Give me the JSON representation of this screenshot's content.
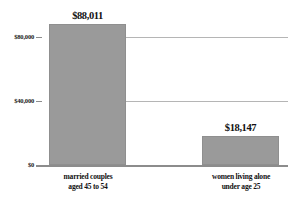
{
  "chart_data": {
    "type": "bar",
    "title": "",
    "subtitle": "",
    "xlabel": "",
    "ylabel": "",
    "orientation": "vertical",
    "grid": true,
    "legend": false,
    "legend_position": "none",
    "ylim": [
      0,
      100000
    ],
    "yticks": [
      0,
      40000,
      80000
    ],
    "ytick_labels": [
      "$0",
      "$40,000",
      "$80,000"
    ],
    "categories": [
      "married couples aged 45 to 54",
      "women living alone under age 25"
    ],
    "values": [
      88011,
      18147
    ],
    "value_labels": [
      "$88,011",
      "$18,147"
    ],
    "bar_color": "#9a9a9a",
    "gridline_color": "#b5b5b5",
    "axis_color": "#8c8c8c",
    "background_color": "#ffffff",
    "text_color": "#111111"
  },
  "axis": {
    "y": {
      "tick_80k": "$80,000",
      "tick_40k": "$40,000",
      "tick_0": "$0"
    }
  },
  "bars": [
    {
      "value_label": "$88,011",
      "category_line1": "married couples",
      "category_line2": "aged 45 to 54"
    },
    {
      "value_label": "$18,147",
      "category_line1": "women living alone",
      "category_line2": "under age 25"
    }
  ]
}
